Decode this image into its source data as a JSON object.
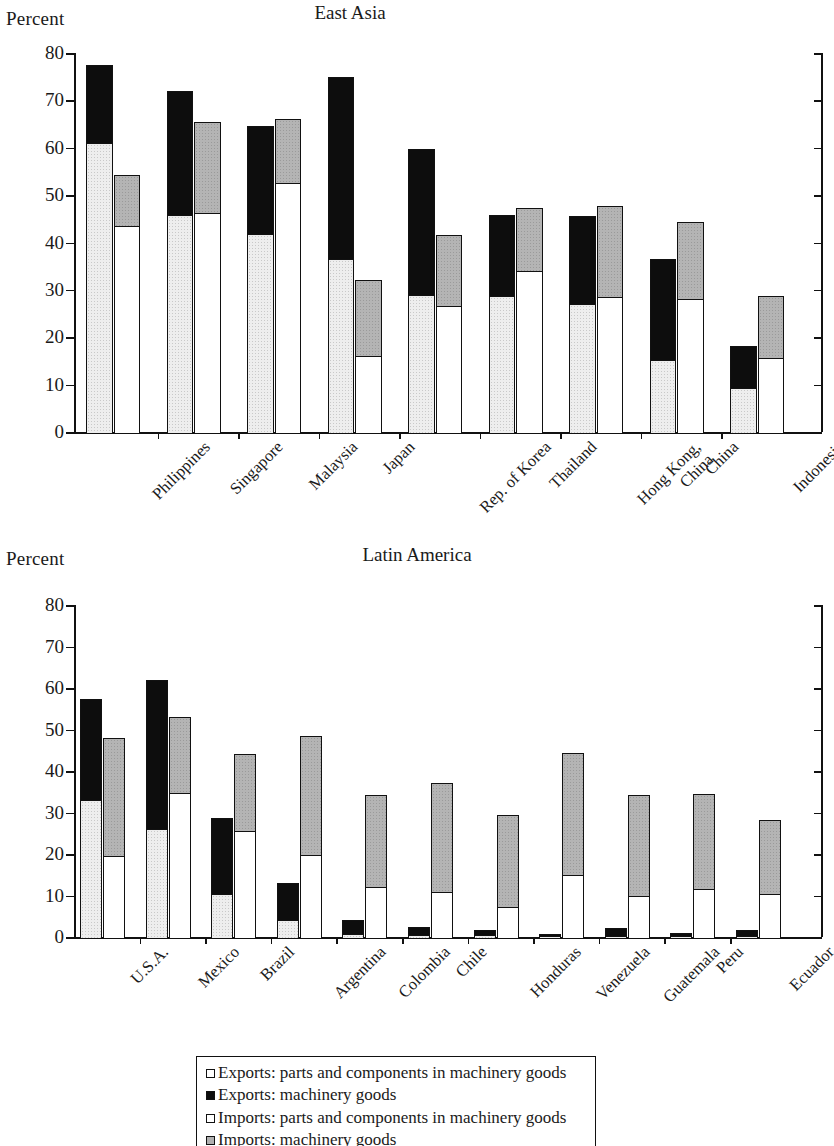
{
  "chart_data": [
    {
      "type": "bar",
      "title": "East Asia",
      "ylabel": "Percent",
      "xlabel": "",
      "ylim": [
        0,
        80
      ],
      "yticks": [
        0,
        10,
        20,
        30,
        40,
        50,
        60,
        70,
        80
      ],
      "grid": false,
      "legend": [
        "Exports: parts and components in machinery goods",
        "Exports: machinery goods",
        "Imports: parts and components in machinery goods",
        "Imports: machinery goods"
      ],
      "legend_position": "below-figure",
      "categories": [
        "Philippines",
        "Singapore",
        "Malaysia",
        "Japan",
        "Rep. of Korea",
        "Thailand",
        "Hong Kong,\nChina",
        "China",
        "Indonesia"
      ],
      "series": [
        {
          "name": "Exports: parts and components in machinery goods",
          "values": [
            61.0,
            45.8,
            41.8,
            36.5,
            29.0,
            28.7,
            27.0,
            15.3,
            9.2
          ]
        },
        {
          "name": "Exports: machinery goods (total)",
          "values": [
            77.5,
            72.0,
            64.5,
            75.0,
            59.8,
            45.8,
            45.6,
            36.5,
            18.2
          ]
        },
        {
          "name": "Imports: parts and components in machinery goods",
          "values": [
            43.4,
            46.2,
            52.5,
            16.0,
            26.5,
            34.0,
            28.6,
            28.0,
            15.7
          ]
        },
        {
          "name": "Imports: machinery goods (total)",
          "values": [
            54.2,
            65.4,
            66.1,
            32.0,
            41.6,
            47.2,
            47.7,
            44.3,
            28.7
          ]
        }
      ]
    },
    {
      "type": "bar",
      "title": "Latin America",
      "ylabel": "Percent",
      "xlabel": "",
      "ylim": [
        0,
        80
      ],
      "yticks": [
        0,
        10,
        20,
        30,
        40,
        50,
        60,
        70,
        80
      ],
      "grid": false,
      "legend": [
        "Exports: parts and components in machinery goods",
        "Exports: machinery goods",
        "Imports: parts and components in machinery goods",
        "Imports: machinery goods"
      ],
      "legend_position": "below-figure",
      "categories": [
        "U.S.A.",
        "Mexico",
        "Brazil",
        "Argentina",
        "Colombia",
        "Chile",
        "Honduras",
        "Venezuela",
        "Guatemala",
        "Peru",
        "Ecuador"
      ],
      "series": [
        {
          "name": "Exports: parts and components in machinery goods",
          "values": [
            33.0,
            26.0,
            10.4,
            4.2,
            0.8,
            0.5,
            0.4,
            0.2,
            0.3,
            0.2,
            0.3
          ]
        },
        {
          "name": "Exports: machinery goods (total)",
          "values": [
            57.3,
            62.0,
            28.6,
            13.1,
            4.1,
            2.5,
            1.8,
            0.8,
            2.1,
            0.9,
            1.6
          ]
        },
        {
          "name": "Imports: parts and components in machinery goods",
          "values": [
            19.5,
            34.8,
            25.6,
            19.8,
            12.1,
            10.8,
            7.2,
            15.0,
            9.8,
            11.5,
            10.4
          ]
        },
        {
          "name": "Imports: machinery goods (total)",
          "values": [
            48.0,
            53.0,
            44.1,
            48.5,
            34.2,
            37.0,
            29.4,
            44.3,
            34.2,
            34.5,
            28.3
          ]
        }
      ]
    }
  ]
}
